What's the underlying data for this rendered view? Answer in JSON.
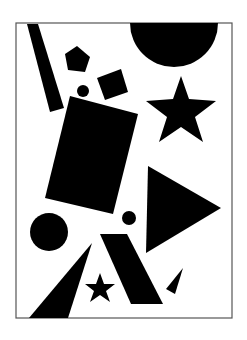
{
  "composition": {
    "background": "#ffffff",
    "ink": "#000000",
    "frame": {
      "x": 16,
      "y": 23,
      "width": 216,
      "height": 295,
      "stroke": "#555555"
    },
    "shapes": [
      {
        "name": "half-circle",
        "type": "path",
        "d": "M130,23 A44,44 0 0 0 218,23 Z"
      },
      {
        "name": "slanted-bar",
        "type": "polygon",
        "points": "27,24 38,24 64,108 50,112"
      },
      {
        "name": "pentagon",
        "type": "polygon",
        "points": "77,46 90,57 85,72 68,70 65,54"
      },
      {
        "name": "diamond-square",
        "type": "polygon",
        "points": "97,78 121,69 128,92 105,100"
      },
      {
        "name": "small-dot-top",
        "type": "circle",
        "cx": 83,
        "cy": 91,
        "r": 6
      },
      {
        "name": "large-star",
        "type": "polygon",
        "points": "181,76 189,99 216,101 195,117 203,142 181,127 159,142 167,117 146,101 173,99"
      },
      {
        "name": "tilted-rectangle",
        "type": "polygon",
        "points": "70,96 138,114 113,214 45,198"
      },
      {
        "name": "right-triangle",
        "type": "polygon",
        "points": "148,166 221,208 146,253"
      },
      {
        "name": "large-circle",
        "type": "circle",
        "cx": 49,
        "cy": 232,
        "r": 19
      },
      {
        "name": "small-dot-bottom",
        "type": "circle",
        "cx": 129,
        "cy": 218,
        "r": 7
      },
      {
        "name": "parallelogram",
        "type": "polygon",
        "points": "100,234 127,234 163,304 131,304"
      },
      {
        "name": "left-wedge-triangle",
        "type": "polygon",
        "points": "92,243 68,318 29,318"
      },
      {
        "name": "small-star",
        "type": "polygon",
        "points": "100,273 104,284 115,284 106,291 110,302 100,295 90,302 94,291 85,284 96,284"
      },
      {
        "name": "small-wedge",
        "type": "polygon",
        "points": "183,268 175,294 166,289"
      }
    ]
  }
}
